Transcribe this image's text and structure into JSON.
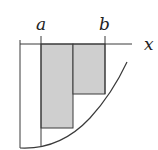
{
  "diagram": {
    "type": "riemann-sum-illustration",
    "labels": {
      "a": "a",
      "b": "b",
      "x_axis": "x"
    },
    "colors": {
      "line": "#3a3a3a",
      "fill": "#cfcfcf",
      "background": "#ffffff"
    },
    "rectangles": [
      {
        "from": "a",
        "to": "midpoint",
        "height_at": "right endpoint"
      },
      {
        "from": "midpoint",
        "to": "b",
        "height_at": "right endpoint"
      }
    ]
  }
}
